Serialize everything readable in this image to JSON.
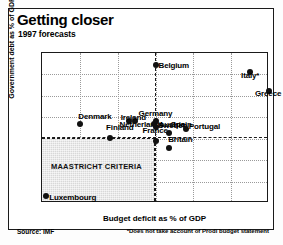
{
  "chart_data": {
    "type": "scatter",
    "title": "Getting closer",
    "subtitle": "1997 forecasts",
    "xlabel": "Budget deficit as % of GDP",
    "ylabel": "Government debt as % of GDP",
    "xlim": [
      0,
      6
    ],
    "ylim": [
      0,
      140
    ],
    "xticks": [
      "0",
      "1",
      "2",
      "3",
      "4",
      "5",
      "6"
    ],
    "yticks": [
      "0",
      "20",
      "40",
      "60",
      "80",
      "100",
      "120",
      "140"
    ],
    "grid": true,
    "legend": "none",
    "source": "Source: IMF",
    "footnote": "*Does not take account of Prodi budget statement",
    "annotations": [
      {
        "name": "maastricht-criteria",
        "label": "MAASTRICHT CRITERIA",
        "type": "shaded-region",
        "x_range": [
          0,
          3
        ],
        "y_range": [
          0,
          60
        ],
        "deficit_threshold": 3,
        "debt_threshold": 60
      }
    ],
    "points": [
      {
        "label": "Luxembourg",
        "x": 0.1,
        "y": 7,
        "lx": 3.5,
        "ly": 2.5,
        "align": "left"
      },
      {
        "label": "Denmark",
        "x": 1.0,
        "y": 74,
        "lx": -1.5,
        "ly": -6.5,
        "align": "left"
      },
      {
        "label": "Finland",
        "x": 1.8,
        "y": 61,
        "lx": -4,
        "ly": -9.5,
        "align": "left"
      },
      {
        "label": "Netherlands",
        "x": 2.3,
        "y": 77,
        "lx": -9.5,
        "ly": 4.5,
        "align": "left"
      },
      {
        "label": "Ireland",
        "x": 2.45,
        "y": 77,
        "lx": -14,
        "ly": -3,
        "align": "left"
      },
      {
        "label": "Germany",
        "x": 2.95,
        "y": 74,
        "lx": -15,
        "ly": -9.5,
        "align": "left"
      },
      {
        "label": "France",
        "x": 3.0,
        "y": 58,
        "lx": -13,
        "ly": -9.5,
        "align": "left"
      },
      {
        "label": "Sweden",
        "x": 3.0,
        "y": 77,
        "lx": 2.5,
        "ly": 5,
        "align": "left"
      },
      {
        "label": "Austria",
        "x": 3.0,
        "y": 71,
        "lx": 3,
        "ly": -1.5,
        "align": "left"
      },
      {
        "label": "Belgium",
        "x": 3.0,
        "y": 129,
        "lx": 3,
        "ly": 1.5,
        "align": "left"
      },
      {
        "label": "Britain",
        "x": 3.35,
        "y": 51,
        "lx": -0.5,
        "ly": -8,
        "align": "left"
      },
      {
        "label": "Spain",
        "x": 3.35,
        "y": 65,
        "lx": 2,
        "ly": -8,
        "align": "left"
      },
      {
        "label": "Portugal",
        "x": 3.8,
        "y": 69,
        "lx": 3,
        "ly": -2.5,
        "align": "left"
      },
      {
        "label": "Italy*",
        "x": 5.5,
        "y": 122,
        "lx": -9,
        "ly": 3.5,
        "align": "left"
      },
      {
        "label": "Greece",
        "x": 6.0,
        "y": 105,
        "lx": -14,
        "ly": 3.5,
        "align": "left"
      }
    ]
  }
}
